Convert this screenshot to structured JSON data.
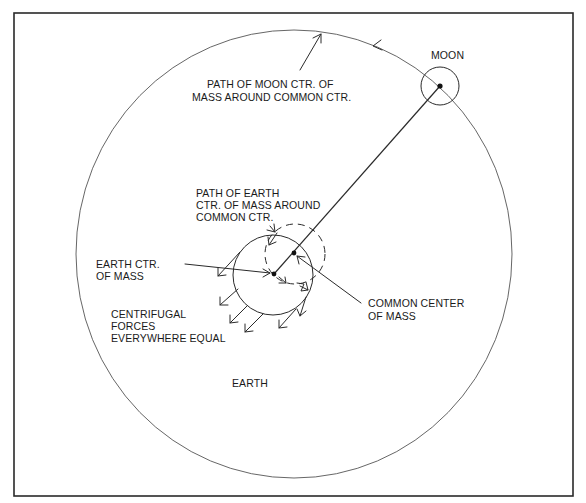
{
  "diagram": {
    "colors": {
      "background": "#ffffff",
      "line": "#2a2a2a",
      "orbit": "#555555",
      "text": "#1a1a1a"
    },
    "labels": {
      "moon": "MOON",
      "moon_path_line1": "PATH OF MOON CTR. OF",
      "moon_path_line2": "MASS AROUND COMMON CTR.",
      "earth_path_line1": "PATH OF EARTH",
      "earth_path_line2": "CTR. OF MASS AROUND",
      "earth_path_line3": "COMMON CTR.",
      "earth_center_line1": "EARTH CTR.",
      "earth_center_line2": "OF MASS",
      "centrifugal_line1": "CENTRIFUGAL",
      "centrifugal_line2": "FORCES",
      "centrifugal_line3": "EVERYWHERE EQUAL",
      "common_center_line1": "COMMON CENTER",
      "common_center_line2": "OF MASS",
      "earth": "EARTH"
    },
    "geometry": {
      "frame": {
        "x": 14,
        "y": 13,
        "width": 559,
        "height": 483
      },
      "moon_orbit": {
        "cx": 294,
        "cy": 254,
        "rx": 218,
        "ry": 224
      },
      "moon": {
        "cx": 440,
        "cy": 86,
        "r": 19
      },
      "earth": {
        "cx": 273,
        "cy": 275,
        "r": 40
      },
      "earth_path": {
        "cx": 295,
        "cy": 254,
        "r": 30
      },
      "earth_center_dot": {
        "cx": 274,
        "cy": 274
      },
      "common_center_dot": {
        "cx": 294,
        "cy": 253
      },
      "moon_center_dot": {
        "cx": 440,
        "cy": 86
      }
    },
    "icons": {
      "centrifugal_arrows": "arrow-icon",
      "orbit_direction": "arrowhead-icon"
    }
  }
}
